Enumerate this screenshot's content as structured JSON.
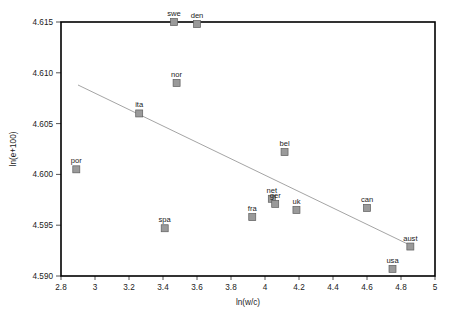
{
  "chart_data": {
    "type": "scatter",
    "title": "",
    "xlabel": "ln(w/c)",
    "ylabel": "ln(e+100)",
    "xlim": [
      2.8,
      5.0
    ],
    "ylim": [
      4.59,
      4.615
    ],
    "grid": false,
    "legend": "none",
    "xticks": [
      "2.8",
      "3",
      "3.2",
      "3.4",
      "3.6",
      "3.8",
      "4",
      "4.2",
      "4.4",
      "4.6",
      "4.8",
      "5"
    ],
    "xtick_values": [
      2.8,
      3.0,
      3.2,
      3.4,
      3.6,
      3.8,
      4.0,
      4.2,
      4.4,
      4.6,
      4.8,
      5.0
    ],
    "yticks": [
      "4.590",
      "4.595",
      "4.600",
      "4.605",
      "4.610",
      "4.615"
    ],
    "ytick_values": [
      4.59,
      4.595,
      4.6,
      4.605,
      4.61,
      4.615
    ],
    "marker_color": "#9a9a9a",
    "marker_edge_color": "#5d5d5d",
    "line_color": "#9a9a9a",
    "points": [
      {
        "label": "swe",
        "x": 3.465,
        "y": 4.615
      },
      {
        "label": "den",
        "x": 3.6,
        "y": 4.6148
      },
      {
        "label": "nor",
        "x": 3.48,
        "y": 4.609
      },
      {
        "label": "ita",
        "x": 3.26,
        "y": 4.606
      },
      {
        "label": "bel",
        "x": 4.115,
        "y": 4.6022
      },
      {
        "label": "por",
        "x": 2.89,
        "y": 4.6005
      },
      {
        "label": "net",
        "x": 4.04,
        "y": 4.5976
      },
      {
        "label": "ger",
        "x": 4.06,
        "y": 4.5971
      },
      {
        "label": "uk",
        "x": 4.185,
        "y": 4.5965
      },
      {
        "label": "can",
        "x": 4.6,
        "y": 4.5967
      },
      {
        "label": "fra",
        "x": 3.925,
        "y": 4.5958
      },
      {
        "label": "spa",
        "x": 3.41,
        "y": 4.5947
      },
      {
        "label": "aust",
        "x": 4.855,
        "y": 4.5929
      },
      {
        "label": "usa",
        "x": 4.75,
        "y": 4.5907
      }
    ],
    "fit_line": {
      "x0": 2.9,
      "y0": 4.6088,
      "x1": 4.87,
      "y1": 4.5929
    }
  }
}
